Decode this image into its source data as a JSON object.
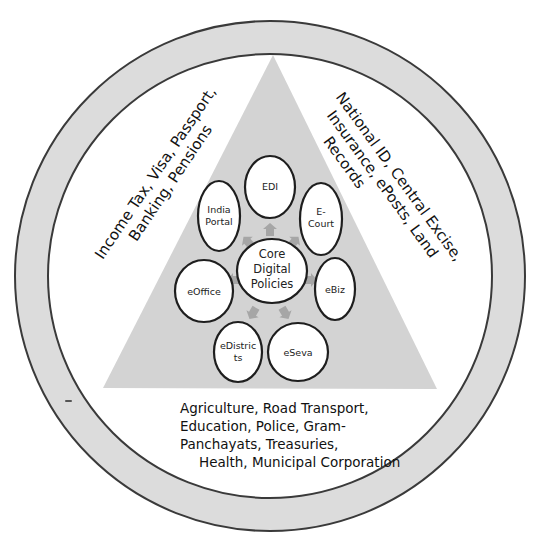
{
  "diagram": {
    "core": {
      "lines": [
        "Core",
        "Digital",
        "Policies"
      ]
    },
    "nodes": [
      {
        "id": "edi",
        "lines": [
          "EDI"
        ]
      },
      {
        "id": "india-portal",
        "lines": [
          "India",
          "Portal"
        ]
      },
      {
        "id": "e-court",
        "lines": [
          "E-",
          "Court"
        ]
      },
      {
        "id": "eoffice",
        "lines": [
          "eOffice"
        ]
      },
      {
        "id": "ebiz",
        "lines": [
          "eBiz"
        ]
      },
      {
        "id": "edistricts",
        "lines": [
          "eDistric",
          "ts"
        ]
      },
      {
        "id": "eseva",
        "lines": [
          "eSeva"
        ]
      }
    ],
    "left_text": {
      "lines": [
        "Income Tax, Visa, Passport,",
        "Banking, Pensions"
      ]
    },
    "right_text": {
      "lines": [
        "National ID, Central Excise,",
        "Insurance,  ePosts, Land",
        "Records"
      ]
    },
    "bottom_text": {
      "lines": [
        "Agriculture, Road Transport,",
        "Education,  Police, Gram-",
        "Panchayats, Treasuries,",
        "Health, Municipal Corporation"
      ]
    },
    "colors": {
      "ring_fill": "#dcdcdc",
      "triangle_fill": "#d3d3d3",
      "node_fill": "#ffffff",
      "node_stroke": "#1e1e1e",
      "arrow_fill": "#a6a6a6",
      "text": "#111111"
    }
  }
}
